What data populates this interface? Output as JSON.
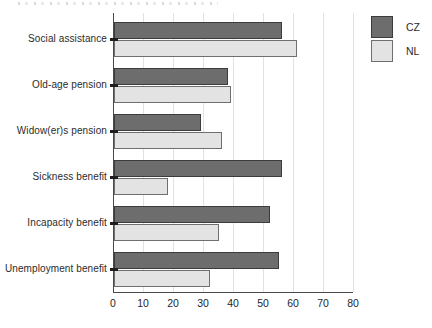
{
  "chart_data": {
    "type": "bar",
    "orientation": "horizontal",
    "title": "",
    "xlabel": "",
    "ylabel": "",
    "categories": [
      "Social assistance",
      "Old-age pension",
      "Widow(er)s pension",
      "Sickness benefit",
      "Incapacity benefit",
      "Unemployment benefit"
    ],
    "series": [
      {
        "name": "CZ",
        "fill": "#6d6d6d",
        "border": "#3c3c3c",
        "values": [
          56,
          38,
          29,
          56,
          52,
          55
        ]
      },
      {
        "name": "NL",
        "fill": "#e3e3e3",
        "border": "#6f6f6f",
        "values": [
          61,
          39,
          36,
          18,
          35,
          32
        ]
      }
    ],
    "xlim": [
      0,
      80
    ],
    "x_ticks": [
      0,
      10,
      20,
      30,
      40,
      50,
      60,
      70,
      80
    ],
    "grid": true,
    "gridline_color": "#e2e2e2",
    "axis_color": "#4a4a4a",
    "text_color": "#2b2b2b",
    "legend_position": "top-right"
  }
}
